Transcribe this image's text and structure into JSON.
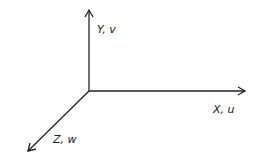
{
  "diagram": {
    "type": "3d-coordinate-axes",
    "axes": [
      {
        "name": "x-axis",
        "label": "X, u",
        "direction": "right"
      },
      {
        "name": "y-axis",
        "label": "Y, v",
        "direction": "up"
      },
      {
        "name": "z-axis",
        "label": "Z, w",
        "direction": "down-left"
      }
    ],
    "colors": {
      "line": "#222222",
      "background": "#ffffff"
    }
  }
}
